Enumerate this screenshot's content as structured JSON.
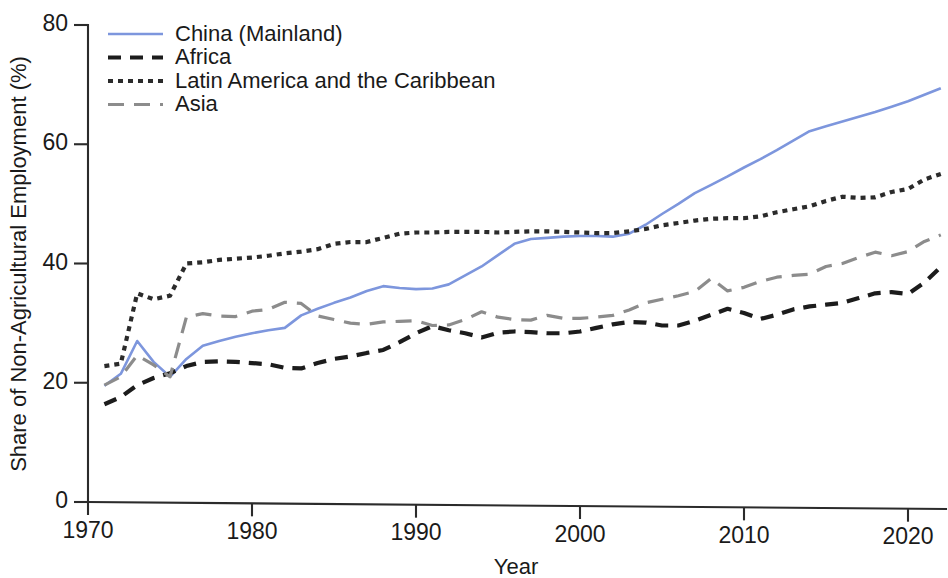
{
  "chart_data": {
    "type": "line",
    "title": "",
    "xlabel": "Year",
    "ylabel": "Share of Non-Agricultural Employment (%)",
    "xlim": [
      1970,
      2022
    ],
    "ylim": [
      0,
      80
    ],
    "xticks": [
      1970,
      1980,
      1990,
      2000,
      2010,
      2020
    ],
    "yticks": [
      0,
      20,
      40,
      60,
      80
    ],
    "grid": false,
    "legend_position": "top-left",
    "x": [
      1971,
      1972,
      1973,
      1974,
      1975,
      1976,
      1977,
      1978,
      1979,
      1980,
      1981,
      1982,
      1983,
      1984,
      1985,
      1986,
      1987,
      1988,
      1989,
      1990,
      1991,
      1992,
      1993,
      1994,
      1995,
      1996,
      1997,
      1998,
      1999,
      2000,
      2001,
      2002,
      2003,
      2004,
      2005,
      2006,
      2007,
      2008,
      2009,
      2010,
      2011,
      2012,
      2013,
      2014,
      2015,
      2016,
      2017,
      2018,
      2019,
      2020,
      2021,
      2022
    ],
    "series": [
      {
        "name": "China (Mainland)",
        "color": "#7d96dd",
        "style": "solid",
        "values": [
          19.5,
          21.5,
          27.0,
          23.5,
          21.0,
          24.0,
          26.2,
          27.0,
          27.7,
          28.3,
          28.8,
          29.2,
          31.3,
          32.4,
          33.4,
          34.3,
          35.4,
          36.2,
          35.9,
          35.7,
          35.8,
          36.5,
          38.0,
          39.5,
          41.4,
          43.3,
          44.1,
          44.3,
          44.5,
          44.6,
          44.6,
          44.5,
          45.0,
          46.5,
          48.3,
          50.0,
          51.8,
          53.2,
          54.6,
          56.1,
          57.5,
          59.0,
          60.6,
          62.2,
          63.0,
          63.8,
          64.6,
          65.4,
          66.3,
          67.2,
          68.3,
          69.4
        ]
      },
      {
        "name": "Africa",
        "color": "#1c1c1c",
        "style": "dashed",
        "values": [
          16.4,
          17.6,
          19.6,
          20.8,
          21.6,
          22.8,
          23.5,
          23.6,
          23.5,
          23.3,
          23.1,
          22.5,
          22.4,
          23.3,
          24.0,
          24.4,
          25.0,
          25.5,
          26.8,
          28.3,
          29.5,
          28.8,
          28.3,
          27.6,
          28.4,
          28.6,
          28.5,
          28.3,
          28.3,
          28.6,
          29.2,
          29.8,
          30.2,
          30.1,
          29.6,
          29.6,
          30.4,
          31.4,
          32.4,
          31.7,
          30.7,
          31.4,
          32.3,
          32.8,
          33.1,
          33.4,
          34.2,
          35.0,
          35.2,
          34.9,
          36.8,
          39.4
        ]
      },
      {
        "name": "Latin America and the Caribbean",
        "color": "#2b2b2b",
        "style": "dotted",
        "values": [
          22.8,
          23.2,
          35.0,
          34.0,
          34.6,
          40.0,
          40.2,
          40.6,
          40.8,
          41.0,
          41.3,
          41.7,
          42.0,
          42.4,
          43.3,
          43.6,
          43.6,
          44.3,
          45.0,
          45.2,
          45.2,
          45.3,
          45.3,
          45.3,
          45.2,
          45.3,
          45.4,
          45.4,
          45.3,
          45.2,
          45.1,
          45.1,
          45.4,
          45.8,
          46.4,
          46.8,
          47.2,
          47.5,
          47.6,
          47.6,
          47.9,
          48.6,
          49.1,
          49.6,
          50.5,
          51.2,
          51.0,
          51.1,
          52.0,
          52.5,
          54.1,
          55.0
        ]
      },
      {
        "name": "Asia",
        "color": "#8c8c8c",
        "style": "longdash",
        "values": [
          19.6,
          21.0,
          24.6,
          23.0,
          21.0,
          31.0,
          31.6,
          31.2,
          31.1,
          32.0,
          32.3,
          33.5,
          33.3,
          31.2,
          30.6,
          30.0,
          29.8,
          30.2,
          30.3,
          30.4,
          29.6,
          29.7,
          30.6,
          31.9,
          31.0,
          30.6,
          30.5,
          31.3,
          30.8,
          30.8,
          31.0,
          31.3,
          32.2,
          33.4,
          34.0,
          34.6,
          35.3,
          37.5,
          35.4,
          36.0,
          37.0,
          37.7,
          38.0,
          38.2,
          39.5,
          40.0,
          41.0,
          41.9,
          41.3,
          42.0,
          43.7,
          44.8
        ]
      }
    ]
  },
  "axes": {
    "y_label": "Share of Non-Agricultural Employment (%)",
    "x_label": "Year",
    "y_tick_labels": [
      "0",
      "20",
      "40",
      "60",
      "80"
    ],
    "x_tick_labels": [
      "1970",
      "1980",
      "1990",
      "2000",
      "2010",
      "2020"
    ]
  },
  "legend": {
    "entries": [
      {
        "label": "China (Mainland)"
      },
      {
        "label": "Africa"
      },
      {
        "label": "Latin America and the Caribbean"
      },
      {
        "label": "Asia"
      }
    ]
  }
}
